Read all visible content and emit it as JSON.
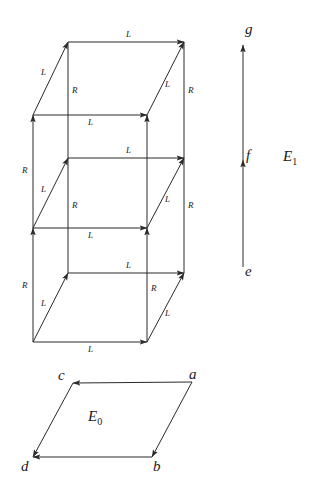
{
  "figure": {
    "stroke_color": "#2a2a2a",
    "background": "#ffffff"
  },
  "objects": {
    "e0_label": "E",
    "e0_sub": "0",
    "e1_label": "E",
    "e1_sub": "1"
  },
  "base_vertices": [
    {
      "name": "a",
      "label": "a",
      "x": 192,
      "y": 382,
      "label_x": 188,
      "label_y": 368
    },
    {
      "name": "b",
      "label": "b",
      "x": 152,
      "y": 457,
      "label_x": 153,
      "label_y": 461
    },
    {
      "name": "c",
      "label": "c",
      "x": 73,
      "y": 383,
      "label_x": 58,
      "label_y": 369
    },
    {
      "name": "d",
      "label": "d",
      "x": 33,
      "y": 457,
      "label_x": 22,
      "label_y": 461
    }
  ],
  "fiber_vertices": [
    {
      "name": "e",
      "label": "e",
      "x": 243,
      "y": 267,
      "label_x": 245,
      "label_y": 265
    },
    {
      "name": "f",
      "label": "f",
      "x": 243,
      "y": 160,
      "label_x": 247,
      "label_y": 148
    },
    {
      "name": "g",
      "label": "g",
      "x": 243,
      "y": 45,
      "label_x": 245,
      "label_y": 22
    }
  ],
  "base_edges": [
    {
      "from": "a",
      "to": "c",
      "direction": "leftward"
    },
    {
      "from": "a",
      "to": "b",
      "direction": "downward"
    },
    {
      "from": "c",
      "to": "d",
      "direction": "downward"
    },
    {
      "from": "b",
      "to": "d",
      "direction": "leftward"
    }
  ],
  "fiber_edges": [
    {
      "from": "e",
      "to": "f",
      "label": ""
    },
    {
      "from": "f",
      "to": "g",
      "label": ""
    }
  ],
  "cube_geometry": {
    "x_back_left": 68,
    "x_front_left": 33,
    "x_back_right": 184,
    "x_front_right": 147,
    "y_back_levels": [
      42,
      158,
      273
    ],
    "y_front_levels": [
      115,
      228,
      342
    ]
  },
  "edge_labels": {
    "L": "L",
    "R": "R"
  },
  "cube_edges": [
    {
      "id": "top-back-horiz",
      "label": "L",
      "label_x": 126,
      "label_y": 36,
      "orientation": "horizontal"
    },
    {
      "id": "top-left-diag",
      "label": "L",
      "label_x": 44,
      "label_y": 73,
      "orientation": "diagonal"
    },
    {
      "id": "top-right-diag",
      "label": "L",
      "label_x": 167,
      "label_y": 85,
      "orientation": "diagonal"
    },
    {
      "id": "upper-left-vert",
      "label": "R",
      "label_x": 72,
      "label_y": 92,
      "orientation": "vertical"
    },
    {
      "id": "upper-right-vert",
      "label": "R",
      "label_x": 188,
      "label_y": 92,
      "orientation": "vertical"
    },
    {
      "id": "mid-front-horiz-1",
      "label": "L",
      "label_x": 88,
      "label_y": 119,
      "orientation": "horizontal"
    },
    {
      "id": "mid-back-horiz",
      "label": "L",
      "label_x": 126,
      "label_y": 152,
      "orientation": "horizontal"
    },
    {
      "id": "mid-left-diag",
      "label": "L",
      "label_x": 44,
      "label_y": 190,
      "orientation": "diagonal"
    },
    {
      "id": "mid-right-diag",
      "label": "L",
      "label_x": 167,
      "label_y": 200,
      "orientation": "diagonal"
    },
    {
      "id": "mid-left-vert",
      "label": "R",
      "label_x": 72,
      "label_y": 207,
      "orientation": "vertical"
    },
    {
      "id": "far-left-vert",
      "label": "R",
      "label_x": 24,
      "label_y": 172,
      "orientation": "vertical"
    },
    {
      "id": "mid-right-vert",
      "label": "R",
      "label_x": 188,
      "label_y": 207,
      "orientation": "vertical"
    },
    {
      "id": "low-front-horiz",
      "label": "L",
      "label_x": 88,
      "label_y": 232,
      "orientation": "horizontal"
    },
    {
      "id": "low-back-horiz",
      "label": "L",
      "label_x": 126,
      "label_y": 267,
      "orientation": "horizontal"
    },
    {
      "id": "low-left-diag",
      "label": "L",
      "label_x": 44,
      "label_y": 304,
      "orientation": "diagonal"
    },
    {
      "id": "low-right-diag",
      "label": "L",
      "label_x": 167,
      "label_y": 314,
      "orientation": "diagonal"
    },
    {
      "id": "bottom-left-vert",
      "label": "R",
      "label_x": 24,
      "label_y": 287,
      "orientation": "vertical"
    },
    {
      "id": "bottom-right-vert",
      "label": "R",
      "label_x": 152,
      "label_y": 290,
      "orientation": "vertical"
    },
    {
      "id": "bottom-front-horiz",
      "label": "L",
      "label_x": 88,
      "label_y": 346,
      "orientation": "horizontal"
    }
  ]
}
